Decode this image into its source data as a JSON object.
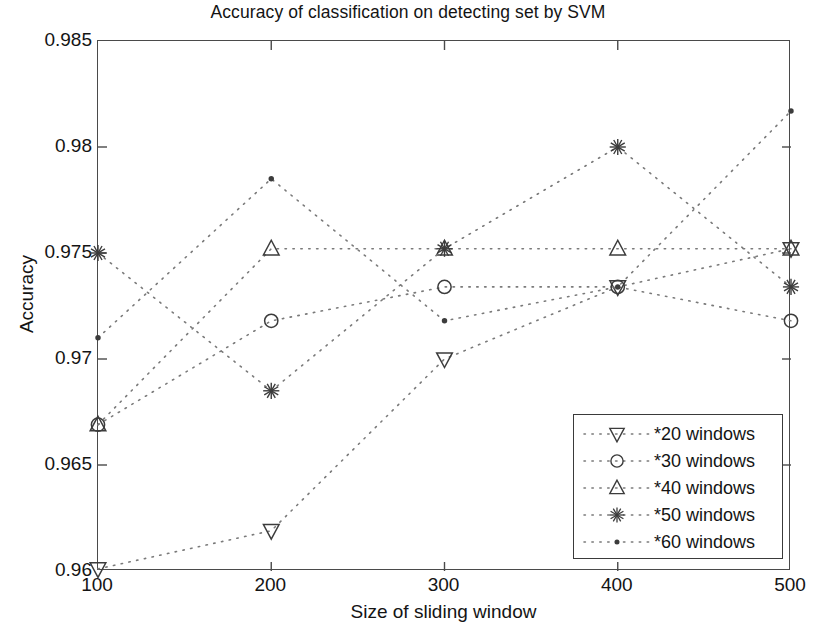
{
  "chart_data": {
    "type": "scatter",
    "title": "Accuracy of classification on detecting set by SVM",
    "xlabel": "Size of sliding window",
    "ylabel": "Accuracy",
    "x": [
      100,
      200,
      300,
      400,
      500
    ],
    "xticklabels": [
      "100",
      "200",
      "300",
      "400",
      "500"
    ],
    "yticks": [
      0.96,
      0.965,
      0.97,
      0.975,
      0.98,
      0.985
    ],
    "yticklabels": [
      "0.96",
      "0.965",
      "0.97",
      "0.975",
      "0.98",
      "0.985"
    ],
    "xlim": [
      100,
      500
    ],
    "ylim": [
      0.96,
      0.985
    ],
    "grid": false,
    "linestyle": "dotted",
    "legend_position": "lower right",
    "series": [
      {
        "name": "*20 windows",
        "marker": "down-triangle",
        "values": [
          0.9601,
          0.9619,
          0.97,
          0.9734,
          0.9752
        ]
      },
      {
        "name": "*30 windows",
        "marker": "circle",
        "values": [
          0.9669,
          0.9718,
          0.9734,
          0.9734,
          0.9718
        ]
      },
      {
        "name": "*40 windows",
        "marker": "up-triangle",
        "values": [
          0.9669,
          0.9752,
          0.9752,
          0.9752,
          0.9752
        ]
      },
      {
        "name": "*50 windows",
        "marker": "asterisk",
        "values": [
          0.975,
          0.9685,
          0.9752,
          0.98,
          0.9734
        ]
      },
      {
        "name": "*60 windows",
        "marker": "dot",
        "values": [
          0.971,
          0.9785,
          0.9718,
          0.9734,
          0.9817
        ]
      }
    ],
    "colors": {
      "series_line": "#7a7a7a",
      "marker": "#3c3c3c",
      "axis": "#4a4a4a",
      "text": "#141414",
      "background": "#ffffff"
    }
  }
}
